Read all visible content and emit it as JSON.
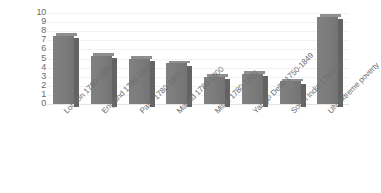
{
  "chart_data": {
    "type": "bar",
    "title": "",
    "subtitle": "",
    "xlabel": "",
    "ylabel": "",
    "ylim": [
      0,
      10
    ],
    "ytick_step": 1,
    "yticks": [
      "10",
      "9",
      "8",
      "7",
      "6",
      "5",
      "4",
      "3",
      "2",
      "1",
      "0"
    ],
    "grid": true,
    "legend": false,
    "legend_position": "none",
    "style": "3d-column",
    "bar_color": "#7a7a7a",
    "bar_side_color": "#636363",
    "bar_top_color": "#8e8e8e",
    "gridline_color": "#f2f2f2",
    "axis_text_color": "#6b6b6b",
    "background_color": "#ffffff",
    "xtick_rotation": -45,
    "categories": [
      "London 1780-1800",
      "England 1780-1800",
      "Paris 1780-1800",
      "Madrid 1780-1800",
      "Milan 1780-1800",
      "Yangzi Delta 1750-1849",
      "South India 1750-90",
      "UN extreme poverty"
    ],
    "values": [
      7.5,
      5.3,
      5.0,
      4.5,
      3.0,
      3.3,
      2.5,
      9.6
    ]
  }
}
